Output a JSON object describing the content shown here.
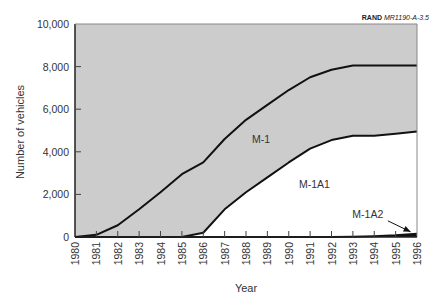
{
  "source": {
    "org": "RAND",
    "id": "MR1190-A-3.5"
  },
  "chart_data": {
    "type": "area",
    "stacked": true,
    "title": "",
    "xlabel": "Year",
    "ylabel": "Number of vehicles",
    "x": [
      1980,
      1981,
      1982,
      1983,
      1984,
      1985,
      1986,
      1987,
      1988,
      1989,
      1990,
      1991,
      1992,
      1993,
      1994,
      1995,
      1996
    ],
    "ylim": [
      0,
      10000
    ],
    "yticks": [
      0,
      2000,
      4000,
      6000,
      8000,
      10000
    ],
    "ytick_labels": [
      "0",
      "2,000",
      "4,000",
      "6,000",
      "8,000",
      "10,000"
    ],
    "grid": false,
    "series": [
      {
        "name": "M-1",
        "values": [
          0,
          100,
          550,
          1300,
          2100,
          2950,
          3300,
          3300,
          3400,
          3400,
          3400,
          3350,
          3300,
          3300,
          3300,
          3200,
          3100
        ],
        "color": "#cccccc"
      },
      {
        "name": "M-1A1",
        "values": [
          0,
          0,
          0,
          0,
          0,
          0,
          200,
          1300,
          2100,
          2800,
          3500,
          4150,
          4550,
          4740,
          4710,
          4770,
          4800
        ],
        "color": "#ffffff"
      },
      {
        "name": "M-1A2",
        "values": [
          0,
          0,
          0,
          0,
          0,
          0,
          0,
          0,
          0,
          0,
          0,
          0,
          0,
          10,
          40,
          80,
          150
        ],
        "color": "#111111"
      }
    ],
    "cumulative_totals": [
      0,
      100,
      550,
      1300,
      2100,
      2950,
      3500,
      4600,
      5500,
      6200,
      6900,
      7500,
      7850,
      8050,
      8050,
      8050,
      8050
    ],
    "annotations": [
      {
        "text": "M-1",
        "x": 1988.7,
        "y": 4400
      },
      {
        "text": "M-1A1",
        "x": 1991.2,
        "y": 2300
      },
      {
        "text": "M-1A2",
        "x": 1993.7,
        "y": 900,
        "arrow_to": [
          1995.7,
          150
        ]
      }
    ]
  }
}
